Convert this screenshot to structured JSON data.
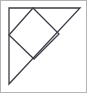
{
  "figure": {
    "canvas": {
      "width": 87,
      "height": 93
    },
    "background_color": "#ffffff",
    "frame": {
      "name": "image-border",
      "visible": true,
      "stroke_color": "#b4b4b4",
      "stroke_width": 1,
      "x": 0.5,
      "y": 0.5,
      "width": 86,
      "height": 92
    },
    "shapes": [
      {
        "name": "outer-right-triangle",
        "type": "polygon",
        "label": "Right triangle",
        "stroke_color": "#3c3c46",
        "stroke_width": 1.3,
        "fill": "none",
        "points": "9,8 80,8 9,84",
        "vertices": [
          {
            "name": "right-angle-vertex",
            "x": 9,
            "y": 8
          },
          {
            "name": "top-right-vertex",
            "x": 80,
            "y": 8
          },
          {
            "name": "bottom-left-vertex",
            "x": 9,
            "y": 84
          }
        ]
      },
      {
        "name": "inscribed-rotated-square",
        "type": "polygon",
        "label": "Inscribed square (diamond)",
        "stroke_color": "#3c3c46",
        "stroke_width": 1.3,
        "fill": "none",
        "points": "33,8 59,34 34,59 9,35",
        "vertices": [
          {
            "name": "square-top-vertex",
            "x": 33,
            "y": 8
          },
          {
            "name": "square-right-vertex",
            "x": 59,
            "y": 34
          },
          {
            "name": "square-bottom-vertex",
            "x": 34,
            "y": 59
          },
          {
            "name": "square-left-vertex",
            "x": 9,
            "y": 35
          }
        ]
      }
    ],
    "labels": []
  }
}
